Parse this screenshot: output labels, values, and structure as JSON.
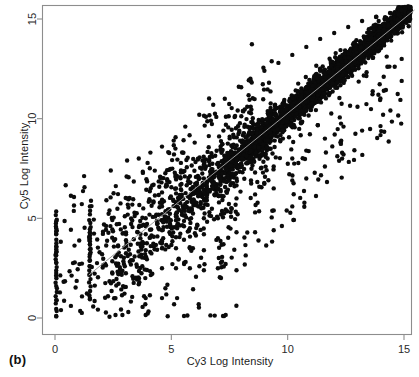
{
  "figure": {
    "panel_caption": "(b)",
    "background_color": "#ffffff",
    "point_color": "#0b0b0b",
    "axis_color": "#8d8d8d",
    "line_color": "#9a9a9a"
  },
  "chart_data": {
    "type": "scatter",
    "title": "",
    "subtitle": "",
    "xlabel": "Cy3 Log Intensity",
    "ylabel": "Cy5 Log Intensity",
    "xlim": [
      -0.55,
      15.6
    ],
    "ylim": [
      -0.55,
      15.6
    ],
    "xticks": [
      0,
      5,
      10,
      15
    ],
    "yticks": [
      0,
      5,
      10,
      15
    ],
    "xtick_labels": [
      "0",
      "5",
      "10",
      "15"
    ],
    "ytick_labels": [
      "0",
      "5",
      "10",
      "15"
    ],
    "grid": false,
    "legend": null,
    "legend_position": "none",
    "annotations": [
      {
        "text": "(b)",
        "position": "below-left-outside"
      }
    ],
    "marker": {
      "shape": "circle",
      "size_px": 4.4,
      "color": "#0b0b0b",
      "filled": true
    },
    "reference_line": {
      "label": "identity / fitted line",
      "x": [
        1.45,
        15.45
      ],
      "y": [
        2.15,
        15.45
      ],
      "color": "#9a9a9a",
      "width_px": 1
    },
    "series": [
      {
        "name": "spots",
        "description": "Microarray spot intensities, Cy3 vs Cy5 log intensity; dense correlated cloud along the diagonal from about 6 to 15 with increasing scatter at low intensity, plus quantized columns near Cy3 = 0 and Cy3 = 1.5 and a floor row near Cy5 = 0.",
        "n_points_approx": 3400,
        "correlation_approx": 0.97,
        "points": [
          [
            0.05,
            5.35
          ],
          [
            0.05,
            4.85
          ],
          [
            0.05,
            4.5
          ],
          [
            0.05,
            4.35
          ],
          [
            0.05,
            4.2
          ],
          [
            0.05,
            3.6
          ],
          [
            0.05,
            3.45
          ],
          [
            0.05,
            3.3
          ],
          [
            0.05,
            3.15
          ],
          [
            0.05,
            2.8
          ],
          [
            0.05,
            2.25
          ],
          [
            0.05,
            1.6
          ],
          [
            0.05,
            0.9
          ],
          [
            0.05,
            0.1
          ],
          [
            1.5,
            5.6
          ],
          [
            1.5,
            4.45
          ],
          [
            1.5,
            4.3
          ],
          [
            1.5,
            4.15
          ],
          [
            1.5,
            4.0
          ],
          [
            1.5,
            3.85
          ],
          [
            1.5,
            3.7
          ],
          [
            1.5,
            3.45
          ],
          [
            1.5,
            3.2
          ],
          [
            1.5,
            2.9
          ],
          [
            1.5,
            2.6
          ],
          [
            1.5,
            2.2
          ],
          [
            1.5,
            1.0
          ],
          [
            2.6,
            1.0
          ],
          [
            2.6,
            0.15
          ],
          [
            3.0,
            5.1
          ],
          [
            3.0,
            4.55
          ],
          [
            3.05,
            4.2
          ],
          [
            3.05,
            3.9
          ],
          [
            3.05,
            3.6
          ],
          [
            3.05,
            3.25
          ],
          [
            3.0,
            2.6
          ],
          [
            3.0,
            1.55
          ],
          [
            3.1,
            6.0
          ],
          [
            3.9,
            5.0
          ],
          [
            3.9,
            4.6
          ],
          [
            3.9,
            4.2
          ],
          [
            3.95,
            3.75
          ],
          [
            3.9,
            3.4
          ],
          [
            3.95,
            2.95
          ],
          [
            3.9,
            1.0
          ],
          [
            3.9,
            0.15
          ],
          [
            4.6,
            6.3
          ],
          [
            4.6,
            5.6
          ],
          [
            4.6,
            5.2
          ],
          [
            4.65,
            4.8
          ],
          [
            4.6,
            4.4
          ],
          [
            4.65,
            4.0
          ],
          [
            4.6,
            3.5
          ],
          [
            4.6,
            2.5
          ],
          [
            4.6,
            1.0
          ],
          [
            5.2,
            6.5
          ],
          [
            5.2,
            5.8
          ],
          [
            5.25,
            5.3
          ],
          [
            5.2,
            4.9
          ],
          [
            5.25,
            4.5
          ],
          [
            5.2,
            4.05
          ],
          [
            5.2,
            3.5
          ],
          [
            5.2,
            2.5
          ],
          [
            5.25,
            1.0
          ],
          [
            5.8,
            6.8
          ],
          [
            5.8,
            6.0
          ],
          [
            5.8,
            5.5
          ],
          [
            5.85,
            5.0
          ],
          [
            5.8,
            4.5
          ],
          [
            5.8,
            3.5
          ],
          [
            5.8,
            2.5
          ],
          [
            6.4,
            7.0
          ],
          [
            6.4,
            6.3
          ],
          [
            6.45,
            5.7
          ],
          [
            6.4,
            5.0
          ],
          [
            6.4,
            4.2
          ],
          [
            6.4,
            3.4
          ],
          [
            6.4,
            2.4
          ],
          [
            7.0,
            7.3
          ],
          [
            7.0,
            6.5
          ],
          [
            7.05,
            5.8
          ],
          [
            7.0,
            5.0
          ],
          [
            7.0,
            4.0
          ],
          [
            7.0,
            2.5
          ],
          [
            7.8,
            7.0
          ],
          [
            7.8,
            6.0
          ],
          [
            7.85,
            5.2
          ],
          [
            7.8,
            4.3
          ],
          [
            7.8,
            2.4
          ],
          [
            8.6,
            7.3
          ],
          [
            8.6,
            6.2
          ],
          [
            8.6,
            5.3
          ],
          [
            8.6,
            4.3
          ],
          [
            9.4,
            7.6
          ],
          [
            9.4,
            6.5
          ],
          [
            9.4,
            5.4
          ],
          [
            9.4,
            4.4
          ],
          [
            10.2,
            8.0
          ],
          [
            10.2,
            6.9
          ],
          [
            10.2,
            5.6
          ],
          [
            10.8,
            8.4
          ],
          [
            10.8,
            7.0
          ],
          [
            11.6,
            9.0
          ],
          [
            11.6,
            7.6
          ],
          [
            12.4,
            9.6
          ],
          [
            12.4,
            8.2
          ],
          [
            13.0,
            10.6
          ],
          [
            13.2,
            9.4
          ],
          [
            13.9,
            11.2
          ],
          [
            14.1,
            10.2
          ],
          [
            14.6,
            12.6
          ],
          [
            14.9,
            13.0
          ],
          [
            2.4,
            7.4
          ],
          [
            3.1,
            7.9
          ],
          [
            3.6,
            8.0
          ],
          [
            4.1,
            8.3
          ],
          [
            4.6,
            8.6
          ],
          [
            5.1,
            8.9
          ],
          [
            5.6,
            9.6
          ],
          [
            6.2,
            10.2
          ],
          [
            6.8,
            10.7
          ],
          [
            7.3,
            11.0
          ],
          [
            7.9,
            11.6
          ],
          [
            8.4,
            12.0
          ],
          [
            9.0,
            12.4
          ],
          [
            9.6,
            12.8
          ],
          [
            10.2,
            13.2
          ],
          [
            10.8,
            13.6
          ],
          [
            11.4,
            14.0
          ],
          [
            12.0,
            14.3
          ],
          [
            12.6,
            14.6
          ],
          [
            13.2,
            14.9
          ],
          [
            13.8,
            15.1
          ],
          [
            14.4,
            15.3
          ],
          [
            14.9,
            15.45
          ],
          [
            15.2,
            15.3
          ]
        ]
      }
    ]
  }
}
